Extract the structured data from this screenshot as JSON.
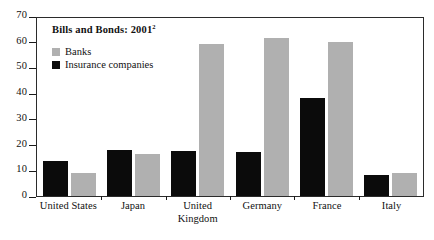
{
  "chart_data": {
    "type": "bar",
    "title": "Bills and Bonds: 2001",
    "title_footnote_marker": "2",
    "xlabel": "",
    "ylabel": "",
    "ylim": [
      0,
      70
    ],
    "ytick_step": 10,
    "yticks": [
      70,
      60,
      50,
      40,
      30,
      20,
      10,
      0
    ],
    "ytick_labels": [
      "70",
      "60",
      "50",
      "40",
      "30",
      "20",
      "10",
      "0"
    ],
    "grid": false,
    "legend_position": "upper-left-inside",
    "categories": [
      "United States",
      "Japan",
      "United Kingdom",
      "Germany",
      "France",
      "Italy"
    ],
    "category_label_lines": [
      [
        "United States"
      ],
      [
        "Japan"
      ],
      [
        "United",
        "Kingdom"
      ],
      [
        "Germany"
      ],
      [
        "France"
      ],
      [
        "Italy"
      ]
    ],
    "series": [
      {
        "name": "Insurance companies",
        "color": "#0b0b0b",
        "values": [
          13.5,
          18,
          17.5,
          17,
          38,
          8
        ]
      },
      {
        "name": "Banks",
        "color": "#b0b0b0",
        "values": [
          9,
          16.5,
          59,
          61.5,
          60,
          9
        ]
      }
    ],
    "series_draw_order": [
      "Insurance companies",
      "Banks"
    ]
  },
  "legend": {
    "entries": [
      {
        "label": "Banks",
        "swatch": "#b0b0b0"
      },
      {
        "label": "Insurance companies",
        "swatch": "#0b0b0b"
      }
    ]
  }
}
